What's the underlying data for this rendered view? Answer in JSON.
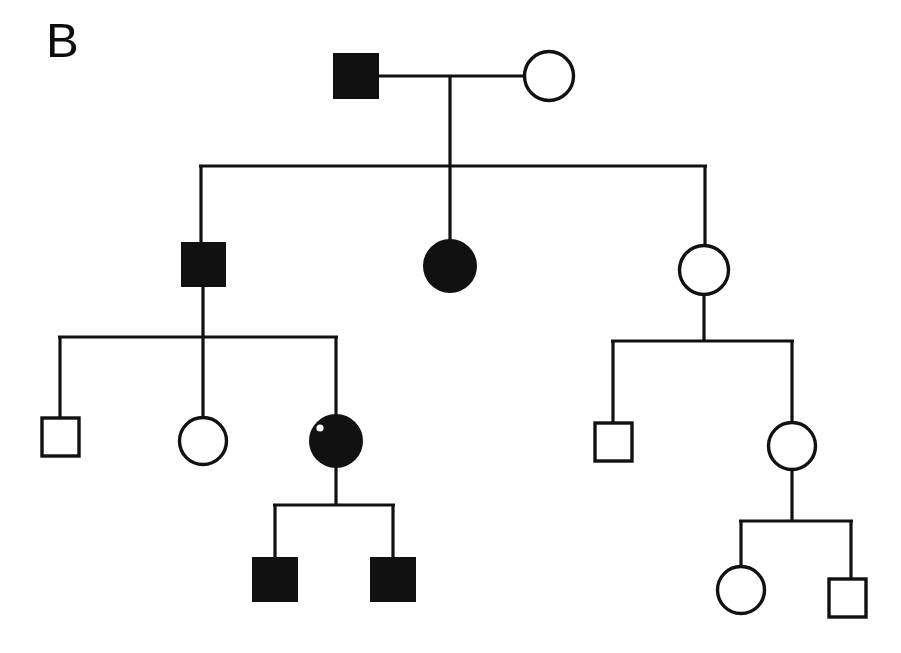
{
  "figure": {
    "panel_label": "B",
    "type": "pedigree-chart",
    "background_color": "#ffffff",
    "line_color": "#111111",
    "affected_fill": "#111111",
    "unaffected_fill": "#ffffff"
  },
  "legend_semantics": {
    "square": "male",
    "circle": "female",
    "filled": "affected",
    "open": "unaffected"
  },
  "generations": [
    {
      "id": "I",
      "individuals": [
        {
          "id": "I-1",
          "shape": "square",
          "status": "affected",
          "sex": "male",
          "cx": 356,
          "cy": 76,
          "size": 44
        },
        {
          "id": "I-2",
          "shape": "circle",
          "status": "unaffected",
          "sex": "female",
          "cx": 549,
          "cy": 76,
          "size": 50
        }
      ]
    },
    {
      "id": "II",
      "individuals": [
        {
          "id": "II-1",
          "shape": "square",
          "status": "affected",
          "sex": "male",
          "cx": 203,
          "cy": 264,
          "size": 43
        },
        {
          "id": "II-2",
          "shape": "circle",
          "status": "affected",
          "sex": "female",
          "cx": 450,
          "cy": 266,
          "size": 52
        },
        {
          "id": "II-3",
          "shape": "circle",
          "status": "unaffected",
          "sex": "female",
          "cx": 704,
          "cy": 270,
          "size": 50
        }
      ]
    },
    {
      "id": "III",
      "individuals": [
        {
          "id": "III-1",
          "shape": "square",
          "status": "unaffected",
          "sex": "male",
          "cx": 60,
          "cy": 437,
          "size": 38
        },
        {
          "id": "III-2",
          "shape": "circle",
          "status": "unaffected",
          "sex": "female",
          "cx": 203,
          "cy": 441,
          "size": 48
        },
        {
          "id": "III-3",
          "shape": "circle",
          "status": "affected",
          "sex": "female",
          "cx": 336,
          "cy": 441,
          "size": 52
        },
        {
          "id": "III-4",
          "shape": "square",
          "status": "unaffected",
          "sex": "male",
          "cx": 613,
          "cy": 441,
          "size": 38
        },
        {
          "id": "III-5",
          "shape": "circle",
          "status": "unaffected",
          "sex": "female",
          "cx": 792,
          "cy": 446,
          "size": 48
        }
      ]
    },
    {
      "id": "IV",
      "individuals": [
        {
          "id": "IV-1",
          "shape": "square",
          "status": "affected",
          "sex": "male",
          "cx": 275,
          "cy": 579,
          "size": 44
        },
        {
          "id": "IV-2",
          "shape": "square",
          "status": "affected",
          "sex": "male",
          "cx": 393,
          "cy": 579,
          "size": 44
        },
        {
          "id": "IV-3",
          "shape": "circle",
          "status": "unaffected",
          "sex": "female",
          "cx": 741,
          "cy": 590,
          "size": 48
        },
        {
          "id": "IV-4",
          "shape": "square",
          "status": "unaffected",
          "sex": "male",
          "cx": 847,
          "cy": 597,
          "size": 38
        }
      ]
    }
  ],
  "connectors": {
    "mating_line_gen1": {
      "x1": 378,
      "x2": 524,
      "y": 76
    },
    "descent_line_gen1": {
      "x": 450,
      "y1": 76,
      "y2": 166
    },
    "sibship_line_gen2": {
      "x1": 201,
      "x2": 705,
      "y": 166
    },
    "sib_drops_gen2": [
      {
        "x": 201,
        "y1": 166,
        "y2": 243
      },
      {
        "x": 450,
        "y1": 166,
        "y2": 241
      },
      {
        "x": 705,
        "y1": 166,
        "y2": 246
      }
    ],
    "descent_line_gen2_left": {
      "x": 203,
      "y1": 285,
      "y2": 337
    },
    "sibship_line_gen3_left": {
      "x1": 60,
      "x2": 336,
      "y": 337
    },
    "sib_drops_gen3_left": [
      {
        "x": 60,
        "y1": 337,
        "y2": 418
      },
      {
        "x": 203,
        "y1": 337,
        "y2": 418
      },
      {
        "x": 336,
        "y1": 337,
        "y2": 416
      }
    ],
    "descent_line_gen2_right": {
      "x": 704,
      "y1": 295,
      "y2": 341
    },
    "sibship_line_gen3_right": {
      "x1": 613,
      "x2": 792,
      "y": 341
    },
    "sib_drops_gen3_right": [
      {
        "x": 613,
        "y1": 341,
        "y2": 423
      },
      {
        "x": 792,
        "y1": 341,
        "y2": 423
      }
    ],
    "descent_line_gen3_left": {
      "x": 336,
      "y1": 467,
      "y2": 505
    },
    "sibship_line_gen4_left": {
      "x1": 275,
      "x2": 393,
      "y": 505
    },
    "sib_drops_gen4_left": [
      {
        "x": 275,
        "y1": 505,
        "y2": 558
      },
      {
        "x": 393,
        "y1": 505,
        "y2": 558
      }
    ],
    "descent_line_gen3_right": {
      "x": 792,
      "y1": 470,
      "y2": 521
    },
    "sibship_line_gen4_right": {
      "x1": 741,
      "x2": 851,
      "y": 521
    },
    "sib_drops_gen4_right": [
      {
        "x": 741,
        "y1": 521,
        "y2": 567
      },
      {
        "x": 851,
        "y1": 521,
        "y2": 579
      }
    ]
  }
}
